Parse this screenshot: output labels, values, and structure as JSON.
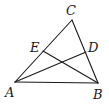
{
  "diagram": {
    "type": "triangle-with-cevians",
    "stroke_color": "#1a1a1a",
    "points": {
      "A": {
        "x": 15,
        "y": 82
      },
      "B": {
        "x": 98,
        "y": 83
      },
      "C": {
        "x": 72,
        "y": 20
      },
      "E": {
        "x": 43,
        "y": 51
      },
      "D": {
        "x": 86,
        "y": 52
      }
    },
    "labels": {
      "A": {
        "text": "A",
        "x": 5,
        "y": 97
      },
      "B": {
        "text": "B",
        "x": 93,
        "y": 99
      },
      "C": {
        "text": "C",
        "x": 66,
        "y": 15
      },
      "E": {
        "text": "E",
        "x": 30,
        "y": 52
      },
      "D": {
        "text": "D",
        "x": 88,
        "y": 52
      }
    },
    "segments": [
      {
        "from": "A",
        "to": "B"
      },
      {
        "from": "B",
        "to": "C"
      },
      {
        "from": "C",
        "to": "A"
      },
      {
        "from": "A",
        "to": "D"
      },
      {
        "from": "B",
        "to": "E"
      }
    ]
  }
}
